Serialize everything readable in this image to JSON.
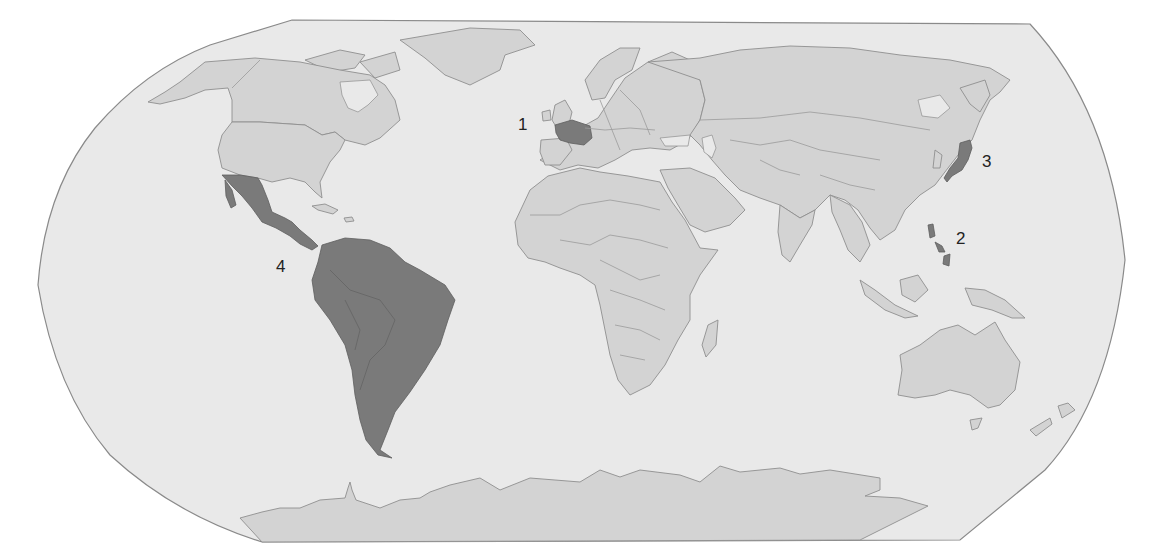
{
  "map": {
    "projection": "robinson-style world map",
    "colors": {
      "ocean": "#e9e9e9",
      "land": "#d3d3d3",
      "highlighted": "#7a7a7a",
      "outline": "#8a8a8a",
      "label_text": "#222222"
    },
    "markers": [
      {
        "id": "1",
        "label": "1",
        "region": "France",
        "x": 524,
        "y": 123
      },
      {
        "id": "2",
        "label": "2",
        "region": "Philippines",
        "x": 955,
        "y": 232
      },
      {
        "id": "3",
        "label": "3",
        "region": "Japan",
        "x": 982,
        "y": 155
      },
      {
        "id": "4",
        "label": "4",
        "region": "Mexico, Central America and South America",
        "x": 277,
        "y": 260
      }
    ]
  }
}
